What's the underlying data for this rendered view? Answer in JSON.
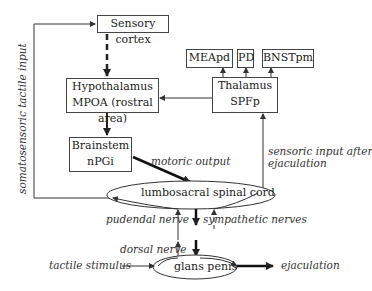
{
  "nodes": {
    "sensory_cortex": "Sensory cortex",
    "hypothalamus": {
      "line1": "Hypothalamus",
      "line2": "MPOA (rostral area)"
    },
    "brainstem": {
      "line1": "Brainstem",
      "line2": "nPGi"
    },
    "thalamus": {
      "line1": "Thalamus",
      "line2": "SPFp"
    },
    "meapd": "MEApd",
    "pd": "PD",
    "bnstpm": "BNSTpm",
    "spinal_cord": "lumbosacral spinal cord",
    "glans_penis": "glans penis"
  },
  "edges": {
    "somatosensoric": "somatosensoric tactile input",
    "motoric_output": "motoric output",
    "sensoric_after_line1": "sensoric input after",
    "sensoric_after_line2": "ejaculation",
    "pudendal": "pudendal nerve",
    "sympathetic": "sympathetic nerves",
    "dorsal": "dorsal nerve",
    "tactile_stimulus": "tactile stimulus",
    "ejaculation": "ejaculation"
  },
  "colors": {
    "line": "#333333",
    "background": "#ffffff"
  }
}
